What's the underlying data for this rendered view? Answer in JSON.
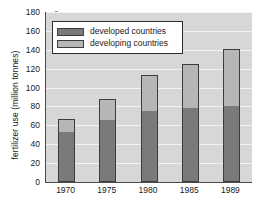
{
  "chart_data": {
    "type": "bar",
    "subtype": "stacked-bar",
    "title": "",
    "xlabel": "",
    "ylabel": "fertilizer use (million tonnes)",
    "categories": [
      "1970",
      "1975",
      "1980",
      "1985",
      "1989"
    ],
    "series": [
      {
        "name": "developed countries",
        "color": "#7a7a7a",
        "values": [
          54,
          66,
          75,
          79,
          81
        ]
      },
      {
        "name": "developing countries",
        "color": "#b6b6b6",
        "values": [
          13,
          22,
          38,
          46,
          60
        ]
      }
    ],
    "totals": [
      67,
      88,
      113,
      125,
      141
    ],
    "ylim": [
      0,
      180
    ],
    "ytick_step": 20,
    "yticks": [
      0,
      20,
      40,
      60,
      80,
      100,
      120,
      140,
      160,
      180
    ],
    "ytick_labels": [
      "0",
      "20",
      "40",
      "60",
      "80",
      "100",
      "120",
      "140",
      "160",
      "180"
    ],
    "grid": true,
    "grid_axis": "y",
    "legend_position": "top-left",
    "plot_background": "#d7d7d7",
    "gridline_color": "#f2f2f2",
    "axis_color": "#4a4a4a"
  },
  "legend": {
    "entries": [
      {
        "label": "developed countries",
        "swatch": "developed"
      },
      {
        "label": "developing countries",
        "swatch": "developing"
      }
    ]
  }
}
